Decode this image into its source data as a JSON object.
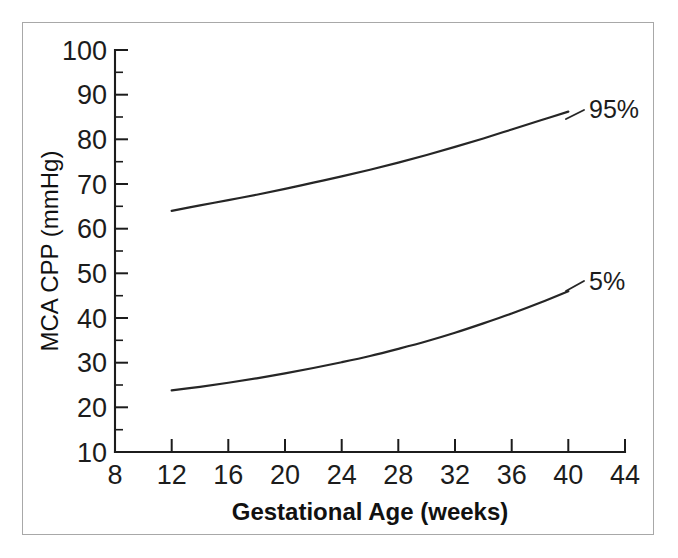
{
  "chart_data": {
    "type": "line",
    "title": "",
    "xlabel": "Gestational Age (weeks)",
    "ylabel": "MCA CPP (mmHg)",
    "xlim": [
      8,
      44
    ],
    "ylim": [
      10,
      100
    ],
    "xticks": [
      8,
      12,
      16,
      20,
      24,
      28,
      32,
      36,
      40,
      44
    ],
    "yticks": [
      10,
      20,
      30,
      40,
      50,
      60,
      70,
      80,
      90,
      100
    ],
    "y_minor_ticks": [
      15,
      25,
      35,
      45,
      55,
      65,
      75,
      85,
      95
    ],
    "grid": false,
    "legend_position": "inline-right-annotations",
    "series": [
      {
        "name": "95%",
        "label": "95%",
        "x": [
          12,
          14,
          16,
          18,
          20,
          22,
          24,
          26,
          28,
          30,
          32,
          34,
          36,
          38,
          40
        ],
        "values": [
          64.0,
          65.2,
          66.4,
          67.6,
          68.9,
          70.3,
          71.7,
          73.2,
          74.8,
          76.5,
          78.3,
          80.2,
          82.2,
          84.2,
          86.2
        ]
      },
      {
        "name": "5%",
        "label": "5%",
        "x": [
          12,
          14,
          16,
          18,
          20,
          22,
          24,
          26,
          28,
          30,
          32,
          34,
          36,
          38,
          40
        ],
        "values": [
          23.8,
          24.6,
          25.5,
          26.5,
          27.6,
          28.8,
          30.1,
          31.5,
          33.1,
          34.8,
          36.7,
          38.8,
          41.0,
          43.4,
          46.0
        ]
      }
    ],
    "annotations": [
      {
        "text": "95%",
        "x": 41.5,
        "y": 88
      },
      {
        "text": "5%",
        "x": 41.5,
        "y": 48
      }
    ]
  },
  "axes": {
    "x_tick_labels": [
      "8",
      "12",
      "16",
      "20",
      "24",
      "28",
      "32",
      "36",
      "40",
      "44"
    ],
    "y_tick_labels": [
      "10",
      "20",
      "30",
      "40",
      "50",
      "60",
      "70",
      "80",
      "90",
      "100"
    ],
    "x_axis_title": "Gestational Age (weeks)",
    "y_axis_title": "MCA CPP (mmHg)"
  },
  "colors": {
    "curve": "#262626",
    "axis": "#1c1c1c",
    "frame_border": "#a8a8a8",
    "background": "#ffffff"
  }
}
